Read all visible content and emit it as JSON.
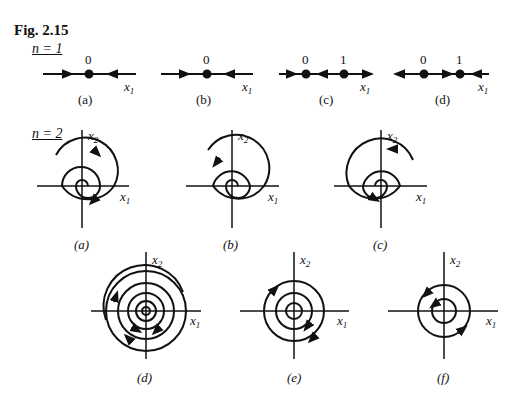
{
  "figure": {
    "title": "Fig. 2.15",
    "row1": {
      "label": "n = 1",
      "panels": [
        {
          "id": "a",
          "caption": "(a)",
          "points": [
            "0"
          ],
          "axis": "x1"
        },
        {
          "id": "b",
          "caption": "(b)",
          "points": [
            "0"
          ],
          "axis": "x1"
        },
        {
          "id": "c",
          "caption": "(c)",
          "points": [
            "0",
            "1"
          ],
          "axis": "x1"
        },
        {
          "id": "d",
          "caption": "(d)",
          "points": [
            "0",
            "1"
          ],
          "axis": "x1"
        }
      ]
    },
    "row2": {
      "label": "n = 2",
      "panels": [
        {
          "id": "a",
          "caption": "(a)",
          "axis_x": "x1",
          "axis_y": "x2"
        },
        {
          "id": "b",
          "caption": "(b)",
          "axis_x": "x1",
          "axis_y": "x2"
        },
        {
          "id": "c",
          "caption": "(c)",
          "axis_x": "x1",
          "axis_y": "x2"
        },
        {
          "id": "d",
          "caption": "(d)",
          "axis_x": "x1",
          "axis_y": "x2"
        },
        {
          "id": "e",
          "caption": "(e)",
          "axis_x": "x1",
          "axis_y": "x2"
        },
        {
          "id": "f",
          "caption": "(f)",
          "axis_x": "x1",
          "axis_y": "x2"
        }
      ]
    },
    "colors": {
      "ink": "#111111",
      "background": "#ffffff"
    }
  }
}
